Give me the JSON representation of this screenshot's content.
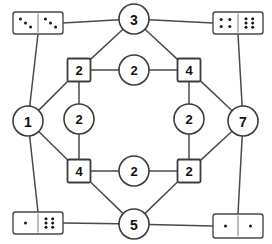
{
  "diagram": {
    "type": "graph",
    "background_color": "#ffffff",
    "line_color": "#4a4a4a",
    "node_fill": "#ffffff",
    "node_stroke": "#3c3c3c",
    "pip_color": "#1a1a1a"
  },
  "outer_nodes": [
    {
      "id": "top",
      "label": "3",
      "shape": "circle",
      "x": 134,
      "y": 19,
      "r": 15
    },
    {
      "id": "left",
      "label": "1",
      "shape": "circle",
      "x": 28,
      "y": 121,
      "r": 15
    },
    {
      "id": "right",
      "label": "7",
      "shape": "circle",
      "x": 243,
      "y": 121,
      "r": 15
    },
    {
      "id": "bottom",
      "label": "5",
      "shape": "circle",
      "x": 134,
      "y": 224,
      "r": 15
    }
  ],
  "inner_nodes": [
    {
      "id": "sq-top-left",
      "label": "2",
      "shape": "square",
      "x": 79,
      "y": 70,
      "size": 23
    },
    {
      "id": "circ-top-mid",
      "label": "2",
      "shape": "circle",
      "x": 134,
      "y": 70,
      "r": 15
    },
    {
      "id": "sq-top-right",
      "label": "4",
      "shape": "square",
      "x": 189,
      "y": 70,
      "size": 23
    },
    {
      "id": "circ-mid-left",
      "label": "2",
      "shape": "circle",
      "x": 79,
      "y": 119,
      "r": 15
    },
    {
      "id": "circ-mid-right",
      "label": "2",
      "shape": "circle",
      "x": 189,
      "y": 119,
      "r": 15
    },
    {
      "id": "sq-bot-left",
      "label": "4",
      "shape": "square",
      "x": 79,
      "y": 171,
      "size": 23
    },
    {
      "id": "circ-bot-mid",
      "label": "2",
      "shape": "circle",
      "x": 134,
      "y": 171,
      "r": 15
    },
    {
      "id": "sq-bot-right",
      "label": "2",
      "shape": "square",
      "x": 189,
      "y": 171,
      "size": 23
    }
  ],
  "dominoes": [
    {
      "id": "domino-top-left",
      "left_pips": 3,
      "right_pips": 3,
      "x": 13,
      "y": 12,
      "w": 50,
      "h": 22
    },
    {
      "id": "domino-top-right",
      "left_pips": 4,
      "right_pips": 6,
      "x": 213,
      "y": 12,
      "w": 50,
      "h": 22
    },
    {
      "id": "domino-bottom-left",
      "left_pips": 1,
      "right_pips": 6,
      "x": 13,
      "y": 212,
      "w": 50,
      "h": 22
    },
    {
      "id": "domino-bottom-right",
      "left_pips": 1,
      "right_pips": 1,
      "x": 213,
      "y": 214,
      "w": 50,
      "h": 24
    }
  ],
  "edges": [
    {
      "from": "domino-top-left",
      "to": "top",
      "kind": "straight"
    },
    {
      "from": "domino-top-right",
      "to": "top",
      "kind": "straight"
    },
    {
      "from": "domino-top-left",
      "to": "left",
      "kind": "straight"
    },
    {
      "from": "domino-top-right",
      "to": "right",
      "kind": "straight"
    },
    {
      "from": "domino-bottom-left",
      "to": "left",
      "kind": "straight"
    },
    {
      "from": "domino-bottom-right",
      "to": "right",
      "kind": "straight"
    },
    {
      "from": "domino-bottom-left",
      "to": "bottom",
      "kind": "straight"
    },
    {
      "from": "domino-bottom-right",
      "to": "bottom",
      "kind": "straight"
    },
    {
      "from": "top",
      "to": "sq-top-left",
      "kind": "diagonal"
    },
    {
      "from": "top",
      "to": "sq-top-right",
      "kind": "diagonal"
    },
    {
      "from": "left",
      "to": "sq-top-left",
      "kind": "diagonal"
    },
    {
      "from": "left",
      "to": "sq-bot-left",
      "kind": "diagonal"
    },
    {
      "from": "right",
      "to": "sq-top-right",
      "kind": "diagonal"
    },
    {
      "from": "right",
      "to": "sq-bot-right",
      "kind": "diagonal"
    },
    {
      "from": "bottom",
      "to": "sq-bot-left",
      "kind": "diagonal"
    },
    {
      "from": "bottom",
      "to": "sq-bot-right",
      "kind": "diagonal"
    },
    {
      "from": "sq-top-left",
      "to": "circ-top-mid",
      "kind": "straight"
    },
    {
      "from": "circ-top-mid",
      "to": "sq-top-right",
      "kind": "straight"
    },
    {
      "from": "sq-top-left",
      "to": "circ-mid-left",
      "kind": "straight"
    },
    {
      "from": "circ-mid-left",
      "to": "sq-bot-left",
      "kind": "straight"
    },
    {
      "from": "sq-top-right",
      "to": "circ-mid-right",
      "kind": "straight"
    },
    {
      "from": "circ-mid-right",
      "to": "sq-bot-right",
      "kind": "straight"
    },
    {
      "from": "sq-bot-left",
      "to": "circ-bot-mid",
      "kind": "straight"
    },
    {
      "from": "circ-bot-mid",
      "to": "sq-bot-right",
      "kind": "straight"
    }
  ]
}
